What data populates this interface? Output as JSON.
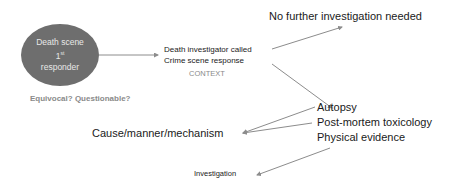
{
  "nodes": {
    "first_responder": {
      "line1": "Death scene",
      "line2_base": "1",
      "line2_sup": "st",
      "line3": "responder",
      "fill": "#6e6e6e"
    },
    "equivocal": "Equivocal? Questionable?",
    "investigator_called": "Death investigator called",
    "crime_scene": "Crime scene response",
    "context": "CONTEXT",
    "no_further": "No further investigation needed",
    "autopsy": "Autopsy",
    "toxicology": "Post-mortem toxicology",
    "physical_evidence": "Physical evidence",
    "cause": "Cause/manner/mechanism",
    "investigation": "Investigation"
  },
  "colors": {
    "arrow": "#8c8c8c",
    "ellipse": "#6e6e6e",
    "muted_text": "#8a8a8a"
  }
}
